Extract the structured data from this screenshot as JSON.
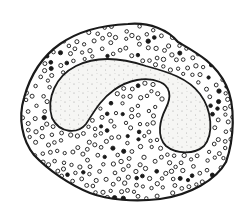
{
  "image": {
    "subject": "Ink drawing of a granular white blood cell with a band-shaped nucleus",
    "alt_text": "Cell drawing with granular cytoplasm and stippled curved nucleus"
  },
  "colors": {
    "background": "#ffffff",
    "ink": "#1a1a1a",
    "nucleus_fill": "#f4f4f2",
    "stipple": "#9a9a9a"
  },
  "cell": {
    "outline_path": "M 128 24 C 150 22 168 30 178 42 C 195 52 215 62 226 85 C 236 105 234 140 226 162 C 216 180 190 195 160 199 C 135 202 108 200 90 193 C 70 185 48 170 34 155 C 22 140 18 118 24 98 C 30 76 40 58 60 44 C 80 30 104 25 128 24 Z"
  },
  "nucleus": {
    "outline_path": "M 52 118 C 46 98 56 76 76 66 C 96 56 122 58 146 66 C 168 72 188 78 200 94 C 212 110 214 134 204 146 C 194 155 176 154 166 146 C 156 136 160 120 166 108 C 172 96 170 86 160 82 C 146 76 128 80 114 90 C 100 100 94 112 86 124 C 78 134 60 134 52 118 Z"
  }
}
